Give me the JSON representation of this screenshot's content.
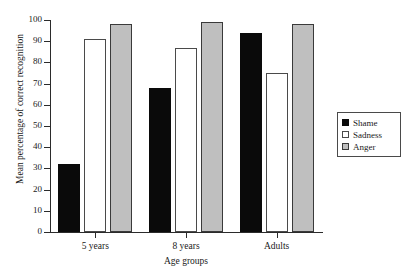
{
  "chart_data": {
    "type": "bar",
    "title": "",
    "xlabel": "Age groups",
    "ylabel": "Mean percentage of correct recognition",
    "categories": [
      "5 years",
      "8 years",
      "Adults"
    ],
    "series": [
      {
        "name": "Shame",
        "color": "#0a0a0a",
        "values": [
          32,
          68,
          94
        ]
      },
      {
        "name": "Sadness",
        "color": "#ffffff",
        "values": [
          91,
          87,
          75
        ]
      },
      {
        "name": "Anger",
        "color": "#bfbfbf",
        "values": [
          98,
          99,
          98
        ]
      }
    ],
    "ylim": [
      0,
      100
    ],
    "yticks": [
      0,
      10,
      20,
      30,
      40,
      50,
      60,
      70,
      80,
      90,
      100
    ],
    "ytick_labels": [
      "0",
      "10",
      "20",
      "30",
      "40",
      "50",
      "60",
      "70",
      "80",
      "90",
      "100"
    ],
    "grid": false,
    "legend_position": "right"
  },
  "legend": {
    "entries": [
      {
        "label": "Shame"
      },
      {
        "label": "Sadness"
      },
      {
        "label": "Anger"
      }
    ]
  }
}
